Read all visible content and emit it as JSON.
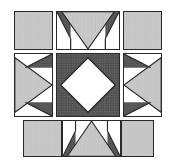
{
  "figure": {
    "width": 174,
    "height": 166,
    "background_color": "#ffffff",
    "outline_color": "#2a2a2a"
  },
  "palette": {
    "light_fabric": "#c9c9c9",
    "light_fabric_speck": "#ababab",
    "dark_fabric": "#4a4a4a",
    "dark_fabric_dot": "#8f8f8f",
    "white_fabric": "#ffffff",
    "outline": "#2a2a2a"
  },
  "legend": {
    "light_label": "light speckled fabric",
    "dark_label": "dark dotted fabric",
    "white_label": "white fabric"
  },
  "grid": {
    "columns": 3,
    "rows": 3,
    "gap": 3,
    "margin_left": 14,
    "margin_top": 11
  },
  "patches": [
    {
      "id": "top-left-plain-square",
      "name": "plain light square",
      "row": 1,
      "col": 1,
      "x": 14,
      "y": 11,
      "w": 39,
      "h": 39,
      "shape": "plain-square",
      "fill": "light"
    },
    {
      "id": "top-center-flying-geese",
      "name": "downward light triangle unit",
      "row": 1,
      "col": 2,
      "x": 56,
      "y": 11,
      "w": 64,
      "h": 39,
      "shape": "triangle-down-unit",
      "fill": "light"
    },
    {
      "id": "top-right-plain-square",
      "name": "plain light square",
      "row": 1,
      "col": 3,
      "x": 123,
      "y": 11,
      "w": 39,
      "h": 39,
      "shape": "plain-square",
      "fill": "light"
    },
    {
      "id": "middle-left-unit",
      "name": "rightward light triangle unit",
      "row": 2,
      "col": 1,
      "x": 14,
      "y": 53,
      "w": 39,
      "h": 64,
      "shape": "triangle-right-unit",
      "fill": "light"
    },
    {
      "id": "center-diamond-square",
      "name": "dark square with white on-point diamond",
      "row": 2,
      "col": 2,
      "x": 56,
      "y": 53,
      "w": 64,
      "h": 64,
      "shape": "square-in-square",
      "fill": "dark"
    },
    {
      "id": "middle-right-unit",
      "name": "leftward light triangle unit",
      "row": 2,
      "col": 3,
      "x": 123,
      "y": 53,
      "w": 39,
      "h": 64,
      "shape": "triangle-left-unit",
      "fill": "light"
    },
    {
      "id": "bottom-left-plain-square",
      "name": "plain light square",
      "row": 3,
      "col": 1,
      "x": 23,
      "y": 120,
      "w": 39,
      "h": 37,
      "shape": "plain-square",
      "fill": "light"
    },
    {
      "id": "bottom-center-flying-geese",
      "name": "upward light triangle unit",
      "row": 3,
      "col": 2,
      "x": 62,
      "y": 120,
      "w": 59,
      "h": 37,
      "shape": "triangle-up-unit",
      "fill": "light"
    },
    {
      "id": "bottom-right-plain-square",
      "name": "plain light square",
      "row": 3,
      "col": 3,
      "x": 121,
      "y": 120,
      "w": 33,
      "h": 37,
      "shape": "plain-square",
      "fill": "light"
    }
  ]
}
